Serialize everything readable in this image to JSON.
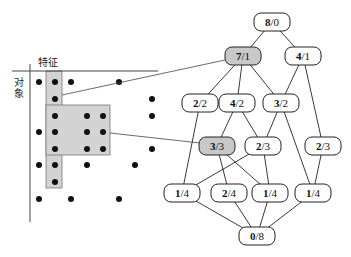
{
  "matrix": {
    "feature_label": "特征",
    "object_label": "对象",
    "columns_x": [
      39,
      55,
      71,
      87,
      103,
      119,
      135,
      152
    ],
    "rows_y": [
      82,
      99,
      116,
      132,
      149,
      165,
      182,
      199
    ],
    "dots": [
      [
        0,
        0
      ],
      [
        0,
        1
      ],
      [
        0,
        2
      ],
      [
        0,
        5
      ],
      [
        1,
        1
      ],
      [
        1,
        7
      ],
      [
        2,
        1
      ],
      [
        2,
        3
      ],
      [
        2,
        4
      ],
      [
        2,
        7
      ],
      [
        3,
        0
      ],
      [
        3,
        1
      ],
      [
        3,
        3
      ],
      [
        3,
        4
      ],
      [
        4,
        1
      ],
      [
        4,
        3
      ],
      [
        4,
        4
      ],
      [
        4,
        7
      ],
      [
        5,
        0
      ],
      [
        5,
        1
      ],
      [
        5,
        3
      ],
      [
        5,
        6
      ],
      [
        6,
        1
      ],
      [
        7,
        0
      ],
      [
        7,
        2
      ],
      [
        7,
        5
      ]
    ],
    "highlight_color": "#d3d3d3",
    "highlight_column": {
      "x": 46,
      "y": 71,
      "w": 16,
      "h": 117
    },
    "highlight_block": {
      "x": 46,
      "y": 105,
      "w": 64,
      "h": 50
    }
  },
  "lattice": {
    "nodes": [
      {
        "id": "n80",
        "top": "8",
        "bottom": "0",
        "x": 272,
        "y": 22,
        "highlight": false
      },
      {
        "id": "n71",
        "top": "7",
        "bottom": "1",
        "x": 243,
        "y": 56,
        "highlight": true
      },
      {
        "id": "n41",
        "top": "4",
        "bottom": "1",
        "x": 303,
        "y": 56,
        "highlight": false
      },
      {
        "id": "n22",
        "top": "2",
        "bottom": "2",
        "x": 200,
        "y": 103,
        "highlight": false
      },
      {
        "id": "n42",
        "top": "4",
        "bottom": "2",
        "x": 237,
        "y": 103,
        "highlight": false
      },
      {
        "id": "n32",
        "top": "3",
        "bottom": "2",
        "x": 281,
        "y": 103,
        "highlight": false
      },
      {
        "id": "n33",
        "top": "3",
        "bottom": "3",
        "x": 217,
        "y": 146,
        "highlight": true
      },
      {
        "id": "n23a",
        "top": "2",
        "bottom": "3",
        "x": 263,
        "y": 146,
        "highlight": false
      },
      {
        "id": "n23b",
        "top": "2",
        "bottom": "3",
        "x": 323,
        "y": 146,
        "highlight": false
      },
      {
        "id": "n14a",
        "top": "1",
        "bottom": "4",
        "x": 182,
        "y": 193,
        "highlight": false
      },
      {
        "id": "n24",
        "top": "2",
        "bottom": "4",
        "x": 229,
        "y": 193,
        "highlight": false
      },
      {
        "id": "n14b",
        "top": "1",
        "bottom": "4",
        "x": 270,
        "y": 193,
        "highlight": false
      },
      {
        "id": "n14c",
        "top": "1",
        "bottom": "4",
        "x": 313,
        "y": 193,
        "highlight": false
      },
      {
        "id": "n08",
        "top": "0",
        "bottom": "8",
        "x": 257,
        "y": 236,
        "highlight": false
      }
    ],
    "edges": [
      [
        "n80",
        "n71"
      ],
      [
        "n80",
        "n41"
      ],
      [
        "n71",
        "n22"
      ],
      [
        "n71",
        "n42"
      ],
      [
        "n71",
        "n32"
      ],
      [
        "n41",
        "n32"
      ],
      [
        "n41",
        "n23b"
      ],
      [
        "n22",
        "n14a"
      ],
      [
        "n42",
        "n33"
      ],
      [
        "n42",
        "n23a"
      ],
      [
        "n32",
        "n23a"
      ],
      [
        "n32",
        "n14c"
      ],
      [
        "n33",
        "n24"
      ],
      [
        "n33",
        "n14b"
      ],
      [
        "n23a",
        "n14a"
      ],
      [
        "n23a",
        "n14b"
      ],
      [
        "n23b",
        "n14c"
      ],
      [
        "n14a",
        "n08"
      ],
      [
        "n24",
        "n08"
      ],
      [
        "n14b",
        "n08"
      ],
      [
        "n14c",
        "n08"
      ]
    ],
    "node_size": {
      "w": 36,
      "h": 18
    },
    "highlight_color": "#c8c8c8",
    "node_fill": "#ffffff"
  },
  "links": [
    {
      "from": [
        62,
        95
      ],
      "to": [
        225,
        60
      ],
      "target": "n71"
    },
    {
      "from": [
        110,
        133
      ],
      "to": [
        200,
        143
      ],
      "target": "n33"
    }
  ]
}
